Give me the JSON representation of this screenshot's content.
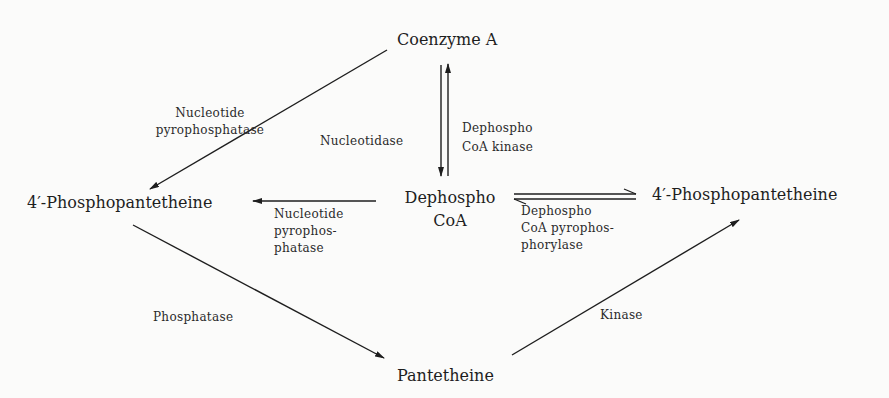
{
  "diagram": {
    "nodes": {
      "coenzyme_a": "Coenzyme A",
      "phosphopantetheine_left": "4′-Phosphopantetheine",
      "dephospho_coa_line1": "Dephospho",
      "dephospho_coa_line2": "CoA",
      "phosphopantetheine_right": "4′-Phosphopantetheine",
      "pantetheine": "Pantetheine"
    },
    "enzymes": {
      "nucleotide_pyrophosphatase_top": [
        "Nucleotide",
        "pyrophosphatase"
      ],
      "nucleotidase": "Nucleotidase",
      "dephospho_coa_kinase": [
        "Dephospho",
        "CoA kinase"
      ],
      "nucleotide_pyrophosphatase_mid": [
        "Nucleotide",
        "pyrophos-",
        "phatase"
      ],
      "dephospho_coa_pyrophosphorylase": [
        "Dephospho",
        "CoA pyrophos-",
        "phorylase"
      ],
      "phosphatase": "Phosphatase",
      "kinase": "Kinase"
    },
    "edges": [
      {
        "from": "Coenzyme A",
        "to": "4′-Phosphopantetheine (left)",
        "enzyme": "Nucleotide pyrophosphatase"
      },
      {
        "from": "Coenzyme A",
        "to": "Dephospho CoA",
        "enzyme": "Nucleotidase"
      },
      {
        "from": "Dephospho CoA",
        "to": "Coenzyme A",
        "enzyme": "Dephospho CoA kinase"
      },
      {
        "from": "Dephospho CoA",
        "to": "4′-Phosphopantetheine (left)",
        "enzyme": "Nucleotide pyrophosphatase"
      },
      {
        "from": "Dephospho CoA",
        "to": "4′-Phosphopantetheine (right)",
        "enzyme": "Dephospho CoA pyrophosphorylase",
        "reversible": true
      },
      {
        "from": "4′-Phosphopantetheine (left)",
        "to": "Pantetheine",
        "enzyme": "Phosphatase"
      },
      {
        "from": "Pantetheine",
        "to": "4′-Phosphopantetheine (right)",
        "enzyme": "Kinase"
      }
    ],
    "colors": {
      "background": "#fbfbfa",
      "ink": "#1e1e1e"
    }
  }
}
